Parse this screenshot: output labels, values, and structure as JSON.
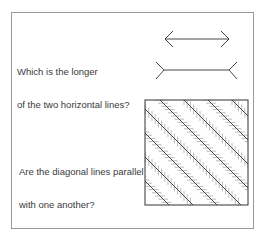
{
  "questions": [
    {
      "line1": "Which is the longer",
      "line2": "of the two horizontal lines?"
    },
    {
      "line1": "Are the diagonal lines parallel",
      "line2": "with one another?"
    }
  ],
  "colors": {
    "ink": "#333333",
    "frame": "#9a9a9a",
    "hatch": "#777777"
  }
}
